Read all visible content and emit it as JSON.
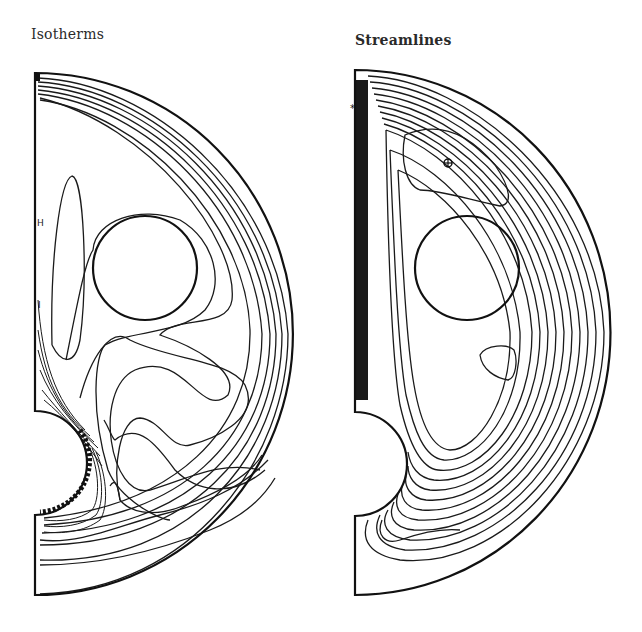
{
  "figure": {
    "panels": [
      {
        "id": "isotherms",
        "title": "Isotherms",
        "contour_labels": [
          "H",
          "I"
        ],
        "geometry": {
          "outer_boundary": "half-ellipse",
          "inner_cylinder": {
            "cx": 145,
            "cy": 268,
            "r": 52
          },
          "cutout_semicircle": {
            "cx": 35,
            "cy": 463,
            "r": 52
          }
        }
      },
      {
        "id": "streamlines",
        "title": "Streamlines",
        "markers": [
          "plus-in-circle"
        ],
        "geometry": {
          "outer_boundary": "half-ellipse",
          "inner_cylinder": {
            "cx": 467,
            "cy": 268,
            "r": 52
          },
          "cutout_semicircle": {
            "cx": 355,
            "cy": 464,
            "r": 52
          }
        }
      }
    ],
    "colors": {
      "line": "#1a1a1a",
      "background": "#ffffff"
    }
  }
}
